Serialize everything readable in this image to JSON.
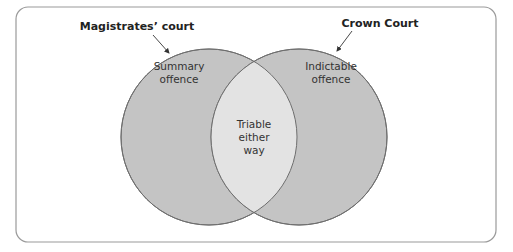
{
  "diagram": {
    "type": "venn",
    "sets": [
      {
        "id": "left",
        "title": "Magistrates’ court",
        "region_label": [
          "Summary",
          "offence"
        ]
      },
      {
        "id": "right",
        "title": "Crown Court",
        "region_label": [
          "Indictable",
          "offence"
        ]
      }
    ],
    "intersection": {
      "label": [
        "Triable",
        "either",
        "way"
      ]
    },
    "colors": {
      "circle_fill": "#c4c4c4",
      "intersection_fill": "#e3e3e3",
      "stroke": "#6e6e6e",
      "frame": "#9a9a9a"
    }
  }
}
